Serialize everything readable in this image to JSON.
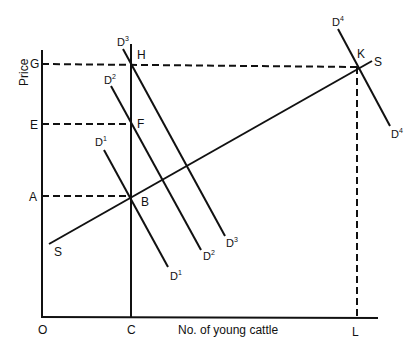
{
  "diagram": {
    "type": "supply-demand",
    "y_axis_label": "Price",
    "x_axis_label": "No. of young cattle",
    "origin_label": "O",
    "price_labels": {
      "g": "G",
      "e": "E",
      "a": "A"
    },
    "quantity_labels": {
      "c": "C",
      "l": "L"
    },
    "points": {
      "h": "H",
      "f": "F",
      "b": "B",
      "k": "K"
    },
    "supply_label": "S",
    "demand_curves": [
      {
        "base": "D",
        "sup": "1"
      },
      {
        "base": "D",
        "sup": "2"
      },
      {
        "base": "D",
        "sup": "3"
      },
      {
        "base": "D",
        "sup": "4"
      }
    ]
  }
}
